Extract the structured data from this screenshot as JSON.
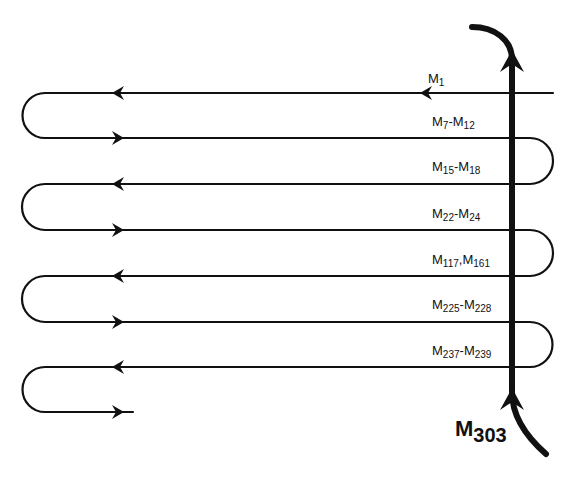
{
  "diagram": {
    "lines": [
      {
        "y": 93,
        "direction": "left",
        "label": [
          "1"
        ]
      },
      {
        "y": 138,
        "direction": "right",
        "label": [
          "7",
          "12"
        ],
        "sep": "-"
      },
      {
        "y": 184,
        "direction": "left",
        "label": [
          "15",
          "18"
        ],
        "sep": "-"
      },
      {
        "y": 230,
        "direction": "right",
        "label": [
          "22",
          "24"
        ],
        "sep": "-"
      },
      {
        "y": 276,
        "direction": "left",
        "label": [
          "117",
          "161"
        ],
        "sep": ","
      },
      {
        "y": 322,
        "direction": "right",
        "label": [
          "225",
          "228"
        ],
        "sep": "-"
      },
      {
        "y": 367,
        "direction": "left",
        "label": [
          "237",
          "239"
        ],
        "sep": "-"
      },
      {
        "y": 412,
        "direction": "right",
        "label": []
      }
    ],
    "labels": {
      "m1": "M",
      "m1_sub": "1",
      "m7_m12_a": "M",
      "m7_m12_a_sub": "7",
      "m7_m12_sep": "-",
      "m7_m12_b": "M",
      "m7_m12_b_sub": "12",
      "m15_m18_a": "M",
      "m15_m18_a_sub": "15",
      "m15_m18_sep": "-",
      "m15_m18_b": "M",
      "m15_m18_b_sub": "18",
      "m22_m24_a": "M",
      "m22_m24_a_sub": "22",
      "m22_m24_sep": "-",
      "m22_m24_b": "M",
      "m22_m24_b_sub": "24",
      "m117_m161_a": "M",
      "m117_m161_a_sub": "117",
      "m117_m161_sep": ",",
      "m117_m161_b": "M",
      "m117_m161_b_sub": "161",
      "m225_m228_a": "M",
      "m225_m228_a_sub": "225",
      "m225_m228_sep": "-",
      "m225_m228_b": "M",
      "m225_m228_b_sub": "228",
      "m237_m239_a": "M",
      "m237_m239_a_sub": "237",
      "m237_m239_sep": "-",
      "m237_m239_b": "M",
      "m237_m239_b_sub": "239",
      "m303": "M",
      "m303_sub": "303"
    },
    "colors": {
      "stroke": "#111111",
      "background": "#ffffff"
    }
  }
}
